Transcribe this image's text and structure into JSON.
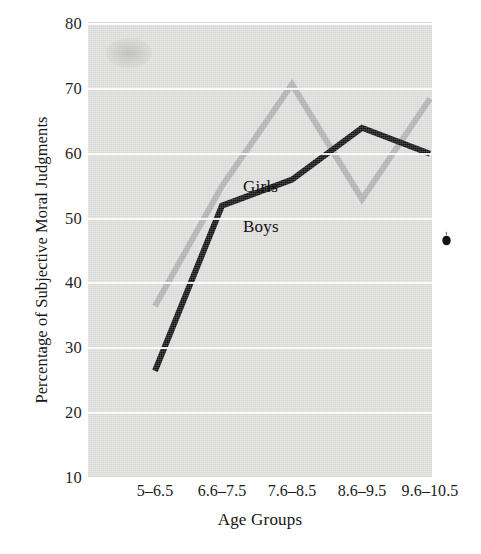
{
  "figure": {
    "background_color": "#ffffff",
    "panel_color": "#dededc",
    "gridline_color": "#fdfdfd"
  },
  "axes": {
    "y_title": "Percentage of Subjective Moral Judgments",
    "x_title": "Age Groups",
    "y_ticks": [
      "80",
      "70",
      "60",
      "50",
      "40",
      "30",
      "20",
      "10"
    ],
    "x_ticks": [
      "5–6.5",
      "6.6–7.5",
      "7.6–8.5",
      "8.6–9.5",
      "9.6–10.5"
    ]
  },
  "series_labels": {
    "girls": "Girls",
    "boys": "Boys"
  },
  "chart_data": {
    "type": "line",
    "title": "",
    "subtitle": "",
    "xlabel": "Age Groups",
    "ylabel": "Percentage of Subjective Moral Judgments",
    "categories": [
      "5–6.5",
      "6.6–7.5",
      "7.6–8.5",
      "8.6–9.5",
      "9.6–10.5"
    ],
    "ylim": [
      10,
      80
    ],
    "yticks": [
      10,
      20,
      30,
      40,
      50,
      60,
      70,
      80
    ],
    "grid": "horizontal",
    "legend": "inline-annotations",
    "series": [
      {
        "name": "Girls",
        "color": "#b2b2b2",
        "line_width": 6,
        "values": [
          36.5,
          55.0,
          70.7,
          53.0,
          68.5
        ]
      },
      {
        "name": "Boys",
        "color": "#111111",
        "line_width": 6,
        "values": [
          26.5,
          52.0,
          56.0,
          64.0,
          60.0
        ]
      }
    ],
    "annotations": [
      {
        "text": "Girls",
        "x_category": "6.6–7.5",
        "y_value": 58.5
      },
      {
        "text": "Boys",
        "x_category": "6.6–7.5",
        "y_value": 52.2
      }
    ]
  }
}
